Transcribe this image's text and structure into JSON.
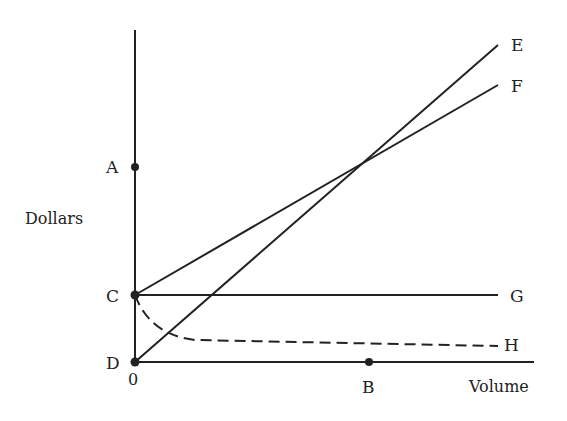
{
  "diagram": {
    "type": "break-even cost-volume diagram",
    "axes": {
      "y_label": "Dollars",
      "x_label": "Volume",
      "origin_label": "0"
    },
    "points": {
      "A": {
        "label": "A",
        "x": 135,
        "y": 167
      },
      "C": {
        "label": "C",
        "x": 135,
        "y": 295
      },
      "D": {
        "label": "D",
        "x": 135,
        "y": 362
      },
      "B": {
        "label": "B",
        "x": 369,
        "y": 362
      }
    },
    "lines": {
      "E": {
        "label": "E",
        "style": "solid",
        "from": "D",
        "to": [
          498,
          45
        ]
      },
      "F": {
        "label": "F",
        "style": "solid",
        "from": "C",
        "to": [
          498,
          85
        ]
      },
      "G": {
        "label": "G",
        "style": "solid",
        "from": "C",
        "to": [
          498,
          295
        ]
      },
      "H": {
        "label": "H",
        "style": "dashed",
        "from": "C",
        "to": [
          498,
          346
        ]
      }
    },
    "colors": {
      "ink": "#222222",
      "background": "#ffffff"
    }
  }
}
